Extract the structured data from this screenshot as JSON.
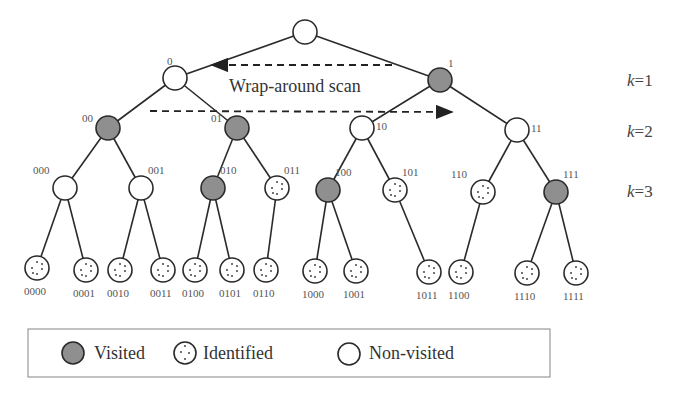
{
  "colors": {
    "visited": "#8f8f8f",
    "identified": "#ffffff",
    "non_visited": "#ffffff",
    "edge": "#2a2a2a"
  },
  "annotation": {
    "scan_label": "Wrap-around scan"
  },
  "levels": [
    {
      "label": "k=1",
      "k": "k",
      "eq": "=1"
    },
    {
      "label": "k=2",
      "k": "k",
      "eq": "=2"
    },
    {
      "label": "k=3",
      "k": "k",
      "eq": "=3"
    }
  ],
  "legend": {
    "items": [
      {
        "state": "visited",
        "label": "Visited"
      },
      {
        "state": "identified",
        "label": "Identified"
      },
      {
        "state": "non_visited",
        "label": "Non-visited"
      }
    ]
  },
  "nodes": [
    {
      "id": "root",
      "label": "",
      "state": "non_visited",
      "x": 305,
      "y": 32
    },
    {
      "id": "0",
      "label": "0",
      "state": "non_visited",
      "x": 175,
      "y": 78
    },
    {
      "id": "1",
      "label": "1",
      "state": "visited",
      "x": 440,
      "y": 80
    },
    {
      "id": "00",
      "label": "00",
      "state": "visited",
      "x": 108,
      "y": 128
    },
    {
      "id": "01",
      "label": "01",
      "state": "visited",
      "x": 237,
      "y": 128
    },
    {
      "id": "10",
      "label": "10",
      "state": "non_visited",
      "x": 362,
      "y": 128
    },
    {
      "id": "11",
      "label": "11",
      "state": "non_visited",
      "x": 517,
      "y": 130
    },
    {
      "id": "000",
      "label": "000",
      "state": "non_visited",
      "x": 65,
      "y": 188
    },
    {
      "id": "001",
      "label": "001",
      "state": "non_visited",
      "x": 141,
      "y": 188
    },
    {
      "id": "010",
      "label": "010",
      "state": "visited",
      "x": 213,
      "y": 188
    },
    {
      "id": "011",
      "label": "011",
      "state": "identified",
      "x": 277,
      "y": 188
    },
    {
      "id": "100",
      "label": "100",
      "state": "visited",
      "x": 328,
      "y": 190
    },
    {
      "id": "101",
      "label": "101",
      "state": "identified",
      "x": 395,
      "y": 190
    },
    {
      "id": "110",
      "label": "110",
      "state": "identified",
      "x": 483,
      "y": 192
    },
    {
      "id": "111",
      "label": "111",
      "state": "visited",
      "x": 556,
      "y": 192
    },
    {
      "id": "0000",
      "label": "0000",
      "state": "identified",
      "x": 37,
      "y": 268
    },
    {
      "id": "0001",
      "label": "0001",
      "state": "identified",
      "x": 86,
      "y": 270
    },
    {
      "id": "0010",
      "label": "0010",
      "state": "identified",
      "x": 120,
      "y": 270
    },
    {
      "id": "0011",
      "label": "0011",
      "state": "identified",
      "x": 163,
      "y": 270
    },
    {
      "id": "0100",
      "label": "0100",
      "state": "identified",
      "x": 195,
      "y": 270
    },
    {
      "id": "0101",
      "label": "0101",
      "state": "identified",
      "x": 232,
      "y": 270
    },
    {
      "id": "0110",
      "label": "0110",
      "state": "identified",
      "x": 266,
      "y": 270
    },
    {
      "id": "1000",
      "label": "1000",
      "state": "identified",
      "x": 315,
      "y": 271
    },
    {
      "id": "1001",
      "label": "1001",
      "state": "identified",
      "x": 356,
      "y": 271
    },
    {
      "id": "1011",
      "label": "1011",
      "state": "identified",
      "x": 429,
      "y": 272
    },
    {
      "id": "1100",
      "label": "1100",
      "state": "identified",
      "x": 461,
      "y": 272
    },
    {
      "id": "1110",
      "label": "1110",
      "state": "identified",
      "x": 527,
      "y": 273
    },
    {
      "id": "1111",
      "label": "1111",
      "state": "identified",
      "x": 576,
      "y": 273
    }
  ],
  "edges": [
    [
      "root",
      "0"
    ],
    [
      "root",
      "1"
    ],
    [
      "0",
      "00"
    ],
    [
      "0",
      "01"
    ],
    [
      "1",
      "10"
    ],
    [
      "1",
      "11"
    ],
    [
      "00",
      "000"
    ],
    [
      "00",
      "001"
    ],
    [
      "01",
      "010"
    ],
    [
      "01",
      "011"
    ],
    [
      "10",
      "100"
    ],
    [
      "10",
      "101"
    ],
    [
      "11",
      "110"
    ],
    [
      "11",
      "111"
    ],
    [
      "000",
      "0000"
    ],
    [
      "000",
      "0001"
    ],
    [
      "001",
      "0010"
    ],
    [
      "001",
      "0011"
    ],
    [
      "010",
      "0100"
    ],
    [
      "010",
      "0101"
    ],
    [
      "011",
      "0110"
    ],
    [
      "100",
      "1000"
    ],
    [
      "100",
      "1001"
    ],
    [
      "101",
      "1011"
    ],
    [
      "110",
      "1100"
    ],
    [
      "111",
      "1110"
    ],
    [
      "111",
      "1111"
    ]
  ]
}
